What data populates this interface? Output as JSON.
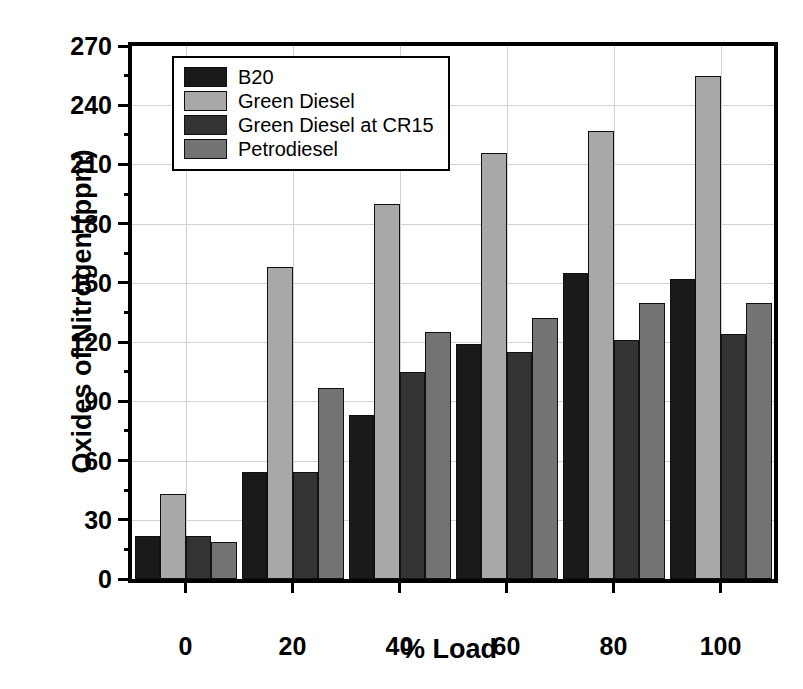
{
  "chart_data": {
    "type": "bar",
    "title": "",
    "xlabel": "% Load",
    "ylabel": "Oxides of Nitrogen (ppm)",
    "categories": [
      "0",
      "20",
      "40",
      "60",
      "80",
      "100"
    ],
    "ylim": [
      0,
      270
    ],
    "yticks": [
      0,
      30,
      60,
      90,
      120,
      150,
      180,
      210,
      240,
      270
    ],
    "ytick_labels": [
      "0",
      "30",
      "60",
      "90",
      "120",
      "150",
      "180",
      "210",
      "240",
      "270"
    ],
    "yminor_step": 15,
    "grid": true,
    "legend_position": "top-left",
    "series": [
      {
        "name": "B20",
        "color": "#1a1a1a",
        "values": [
          22,
          54,
          83,
          119,
          155,
          152
        ]
      },
      {
        "name": "Green Diesel",
        "color": "#a8a8a8",
        "values": [
          43,
          158,
          190,
          216,
          227,
          255
        ]
      },
      {
        "name": "Green Diesel at CR15",
        "color": "#333333",
        "values": [
          22,
          54,
          105,
          115,
          121,
          124
        ]
      },
      {
        "name": "Petrodiesel",
        "color": "#737373",
        "values": [
          19,
          97,
          125,
          132,
          140,
          140
        ]
      }
    ]
  },
  "legend": {
    "items": [
      {
        "label": "B20",
        "color": "#1a1a1a"
      },
      {
        "label": "Green Diesel",
        "color": "#a8a8a8"
      },
      {
        "label": "Green Diesel at CR15",
        "color": "#333333"
      },
      {
        "label": "Petrodiesel",
        "color": "#737373"
      }
    ]
  }
}
